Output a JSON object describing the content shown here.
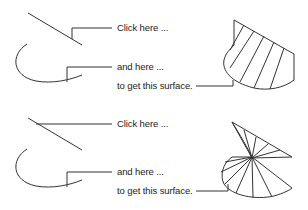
{
  "panels": [
    {
      "id": "top",
      "click_here_label": "Click here ...",
      "and_here_label": "and here ...",
      "result_label": "to get this surface.",
      "surface_type": "ruled-surface-fan"
    },
    {
      "id": "bottom",
      "click_here_label": "Click here ...",
      "and_here_label": "and here ...",
      "result_label": "to get this surface.",
      "surface_type": "ruled-surface-twisted"
    }
  ],
  "colors": {
    "line": "#333333",
    "text": "#222222"
  }
}
